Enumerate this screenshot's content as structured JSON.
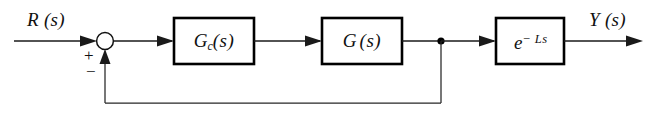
{
  "diagram": {
    "input_label": "R (s)",
    "output_label": "Y (s)",
    "sum_plus": "+",
    "sum_minus": "−",
    "blocks": [
      {
        "id": "controller",
        "label_main": "G",
        "label_sub": "c",
        "label_tail": "(s)"
      },
      {
        "id": "plant",
        "label_main": "G",
        "label_sub": "",
        "label_tail": "(s)"
      },
      {
        "id": "dead-time",
        "label_main": "e",
        "label_sup": "− Ls",
        "label_tail": ""
      }
    ],
    "colors": {
      "line": "#1a1a1a",
      "block_border": "#000000",
      "background": "#ffffff",
      "text": "#111111"
    }
  }
}
